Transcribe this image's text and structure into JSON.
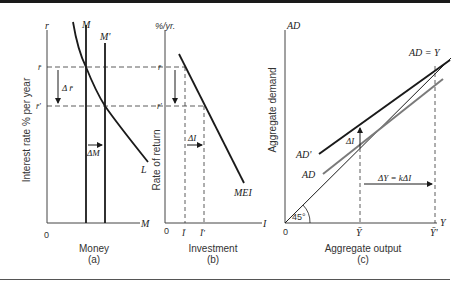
{
  "figure": {
    "panels": [
      {
        "id": "a",
        "caption": "(a)",
        "xlabel": "Money",
        "ylabel": "Interest rate % per year",
        "y_axis_symbol": "r",
        "x_axis_symbol": "M",
        "origin": "0",
        "curves": [
          "M",
          "M'",
          "L"
        ],
        "levels": [
          "r̄",
          "r̄'"
        ],
        "annotations": [
          "Δ r̄",
          "ΔM"
        ]
      },
      {
        "id": "b",
        "caption": "(b)",
        "xlabel": "Investment",
        "ylabel": "Rate of return",
        "y_axis_symbol": "%/yr.",
        "x_axis_symbol": "I",
        "origin": "0",
        "curves": [
          "MEI"
        ],
        "levels": [
          "r̄",
          "r̄'"
        ],
        "x_ticks": [
          "Ī",
          "Ī'"
        ],
        "annotations": [
          "ΔI"
        ]
      },
      {
        "id": "c",
        "caption": "(c)",
        "xlabel": "Aggregate output",
        "ylabel": "Aggregate demand",
        "y_axis_symbol": "AD",
        "x_axis_symbol": "Y",
        "origin": "0",
        "curves": [
          "AD = Y",
          "AD'",
          "AD"
        ],
        "x_ticks": [
          "Ȳ",
          "Ȳ'"
        ],
        "angle_label": "45°",
        "annotations": [
          "ΔI",
          "ΔY = kΔI"
        ]
      }
    ]
  },
  "labels": {
    "a_r": "r",
    "a_M": "M",
    "a_Mp": "M'",
    "a_rbar": "r̄",
    "a_rbarp": "r̄'",
    "a_dr": "Δ r̄",
    "a_dM": "ΔM",
    "a_L": "L",
    "a_xM": "M",
    "a_zero": "0",
    "a_ylabel": "Interest rate % per year",
    "a_xlabel": "Money",
    "a_caption": "(a)",
    "b_pct": "%/yr.",
    "b_rbar": "r̄",
    "b_rbarp": "r̄'",
    "b_dI": "ΔI",
    "b_MEI": "MEI",
    "b_xI": "I",
    "b_zero": "0",
    "b_Ibar": "Ī",
    "b_Ibarp": "Ī'",
    "b_ylabel": "Rate of return",
    "b_xlabel": "Investment",
    "b_caption": "(b)",
    "c_AD": "AD",
    "c_ADY": "AD = Y",
    "c_ADp": "AD'",
    "c_ADc": "AD",
    "c_dI": "ΔI",
    "c_dY": "ΔY = kΔI",
    "c_45": "45°",
    "c_zero": "0",
    "c_Ybar": "Ȳ",
    "c_Ybarp": "Ȳ'",
    "c_xY": "Y",
    "c_ylabel": "Aggregate demand",
    "c_xlabel": "Aggregate output",
    "c_caption": "(c)"
  },
  "colors": {
    "ink": "#1a1a1a",
    "gray_curve": "#7a7a7a",
    "axis": "#444444"
  }
}
